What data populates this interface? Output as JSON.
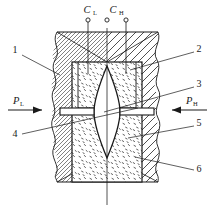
{
  "figure": {
    "type": "technical-cross-section-diagram",
    "colors": {
      "line": "#1a1a1a",
      "background": "#ffffff",
      "fill_stipple": "#ffffff"
    }
  },
  "callouts": {
    "top_ports": [
      {
        "id": "port-left",
        "label": "C",
        "sub": "L"
      },
      {
        "id": "port-center",
        "label": "",
        "sub": ""
      },
      {
        "id": "port-right",
        "label": "C",
        "sub": "H"
      }
    ],
    "pressure_left": {
      "label": "P",
      "sub": "L"
    },
    "pressure_right": {
      "label": "P",
      "sub": "H"
    },
    "numbers": [
      {
        "id": "callout-1",
        "text": "1"
      },
      {
        "id": "callout-2",
        "text": "2"
      },
      {
        "id": "callout-3",
        "text": "3"
      },
      {
        "id": "callout-4",
        "text": "4"
      },
      {
        "id": "callout-5",
        "text": "5"
      },
      {
        "id": "callout-6",
        "text": "6"
      }
    ]
  }
}
